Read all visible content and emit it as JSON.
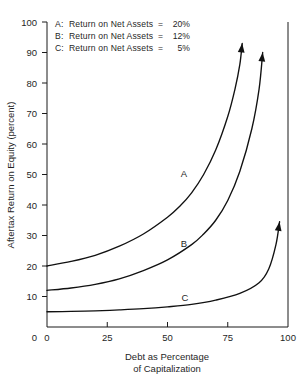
{
  "chart_data": {
    "type": "line",
    "title": "",
    "xlabel": "Debt as Percentage of Capitalization",
    "ylabel": "Aftertax Return on Equity (percent)",
    "xlim": [
      0,
      100
    ],
    "ylim": [
      0,
      100
    ],
    "xticks": [
      0,
      25,
      50,
      75,
      100
    ],
    "yticks": [
      0,
      10,
      20,
      30,
      40,
      50,
      60,
      70,
      80,
      90,
      100
    ],
    "xtick_labels": [
      "0",
      "25",
      "50",
      "75",
      "100"
    ],
    "ytick_labels": [
      "0",
      "10",
      "20",
      "30",
      "40",
      "50",
      "60",
      "70",
      "80",
      "90",
      "100"
    ],
    "grid": false,
    "legend_position": "upper-left-inside",
    "series": [
      {
        "name": "A",
        "label": "A",
        "legend_key": "A",
        "legend_desc": "Return on Net Assets",
        "legend_value": "20%",
        "return_on_net_assets": 20,
        "color": "#111111",
        "has_arrow_terminator": true,
        "points": [
          {
            "x": 0,
            "y": 20.0
          },
          {
            "x": 10,
            "y": 21.5
          },
          {
            "x": 20,
            "y": 23.5
          },
          {
            "x": 30,
            "y": 26.5
          },
          {
            "x": 40,
            "y": 30.5
          },
          {
            "x": 50,
            "y": 36.0
          },
          {
            "x": 55,
            "y": 39.5
          },
          {
            "x": 60,
            "y": 44.0
          },
          {
            "x": 65,
            "y": 50.0
          },
          {
            "x": 70,
            "y": 58.0
          },
          {
            "x": 75,
            "y": 69.0
          },
          {
            "x": 78,
            "y": 78.0
          },
          {
            "x": 80,
            "y": 86.0
          },
          {
            "x": 81,
            "y": 93.0
          }
        ]
      },
      {
        "name": "B",
        "label": "B",
        "legend_key": "B",
        "legend_desc": "Return on Net Assets",
        "legend_value": "12%",
        "return_on_net_assets": 12,
        "color": "#111111",
        "has_arrow_terminator": true,
        "points": [
          {
            "x": 0,
            "y": 12.0
          },
          {
            "x": 10,
            "y": 12.8
          },
          {
            "x": 20,
            "y": 14.0
          },
          {
            "x": 30,
            "y": 15.8
          },
          {
            "x": 40,
            "y": 18.5
          },
          {
            "x": 50,
            "y": 22.0
          },
          {
            "x": 60,
            "y": 27.0
          },
          {
            "x": 65,
            "y": 30.5
          },
          {
            "x": 70,
            "y": 35.0
          },
          {
            "x": 75,
            "y": 41.5
          },
          {
            "x": 80,
            "y": 51.0
          },
          {
            "x": 85,
            "y": 65.0
          },
          {
            "x": 88,
            "y": 78.0
          },
          {
            "x": 89.5,
            "y": 90.0
          }
        ]
      },
      {
        "name": "C",
        "label": "C",
        "legend_key": "C",
        "legend_desc": "Return on Net Assets",
        "legend_value": " 5%",
        "return_on_net_assets": 5,
        "color": "#111111",
        "has_arrow_terminator": true,
        "points": [
          {
            "x": 0,
            "y": 5.0
          },
          {
            "x": 10,
            "y": 5.1
          },
          {
            "x": 20,
            "y": 5.3
          },
          {
            "x": 30,
            "y": 5.6
          },
          {
            "x": 40,
            "y": 6.0
          },
          {
            "x": 50,
            "y": 6.6
          },
          {
            "x": 60,
            "y": 7.4
          },
          {
            "x": 70,
            "y": 8.8
          },
          {
            "x": 80,
            "y": 11.0
          },
          {
            "x": 88,
            "y": 14.5
          },
          {
            "x": 92,
            "y": 19.0
          },
          {
            "x": 95,
            "y": 27.0
          },
          {
            "x": 96.5,
            "y": 34.5
          }
        ]
      }
    ],
    "legend_entries": [
      {
        "key": "A:",
        "desc": "Return on Net Assets",
        "eq": "=",
        "value": "20%"
      },
      {
        "key": "B:",
        "desc": "Return on Net Assets",
        "eq": "=",
        "value": "12%"
      },
      {
        "key": "C:",
        "desc": "Return on Net Assets",
        "eq": "=",
        "value": "5%"
      }
    ],
    "xlabel_lines": [
      "Debt as Percentage",
      "of Capitalization"
    ]
  }
}
